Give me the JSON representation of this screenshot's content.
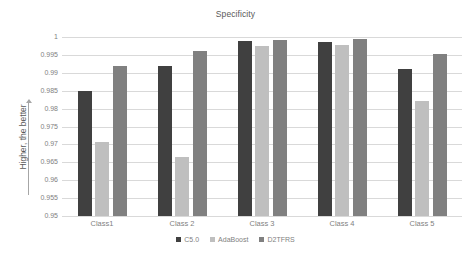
{
  "chart_data": {
    "type": "bar",
    "title": "Specificity",
    "xlabel": "",
    "ylabel": "Higher, the better",
    "ylim": [
      0.95,
      1
    ],
    "ytick_step": 0.005,
    "yticks": [
      "1",
      "0.995",
      "0.99",
      "0.985",
      "0.98",
      "0.975",
      "0.97",
      "0.965",
      "0.96",
      "0.955",
      "0.95"
    ],
    "grid": true,
    "legend_position": "bottom",
    "categories": [
      "Class1",
      "Class 2",
      "Class 3",
      "Class 4",
      "Class 5"
    ],
    "series": [
      {
        "name": "C5.0",
        "color": "#404040",
        "values": [
          0.9848,
          0.992,
          0.9988,
          0.9987,
          0.991
        ]
      },
      {
        "name": "AdaBoost",
        "color": "#bfbfbf",
        "values": [
          0.9707,
          0.9665,
          0.9975,
          0.9977,
          0.982
        ]
      },
      {
        "name": "D2TFRS",
        "color": "#808080",
        "values": [
          0.992,
          0.996,
          0.9992,
          0.9994,
          0.9952
        ]
      }
    ]
  },
  "yaxis": {
    "arrow_icon": "up-arrow-icon"
  }
}
